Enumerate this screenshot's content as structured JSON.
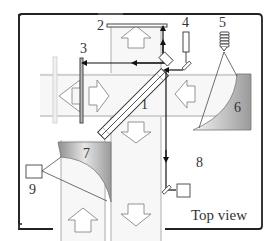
{
  "diagram": {
    "caption": "Top view",
    "labels": {
      "l1": "1",
      "l2": "2",
      "l3": "3",
      "l4": "4",
      "l5": "5",
      "l6": "6",
      "l7": "7",
      "l8": "8",
      "l9": "9"
    },
    "components": [
      {
        "id": "1",
        "name": "beamsplitter",
        "shape": "diagonal-plate"
      },
      {
        "id": "2",
        "name": "top-mirror",
        "shape": "horizontal-bar"
      },
      {
        "id": "3",
        "name": "left-mirror",
        "shape": "vertical-bar"
      },
      {
        "id": "4",
        "name": "light-source",
        "shape": "tube-with-mirror"
      },
      {
        "id": "5",
        "name": "coil-emitter",
        "shape": "coil"
      },
      {
        "id": "6",
        "name": "right-parabolic-mirror",
        "shape": "gradient-curve"
      },
      {
        "id": "7",
        "name": "bottom-left-parabolic-mirror",
        "shape": "gradient-curve"
      },
      {
        "id": "8",
        "name": "detector-right",
        "shape": "square-box"
      },
      {
        "id": "9",
        "name": "detector-left",
        "shape": "square-box"
      }
    ],
    "arrows": [
      "up",
      "left",
      "right",
      "left",
      "down",
      "down",
      "up"
    ],
    "colors": {
      "frame": "#222222",
      "beam": "#111111",
      "arrow_outline": "#888888",
      "channel": "#999999",
      "gradient_dark": "#8a8a8a",
      "gradient_light": "#f2f2f2"
    }
  }
}
